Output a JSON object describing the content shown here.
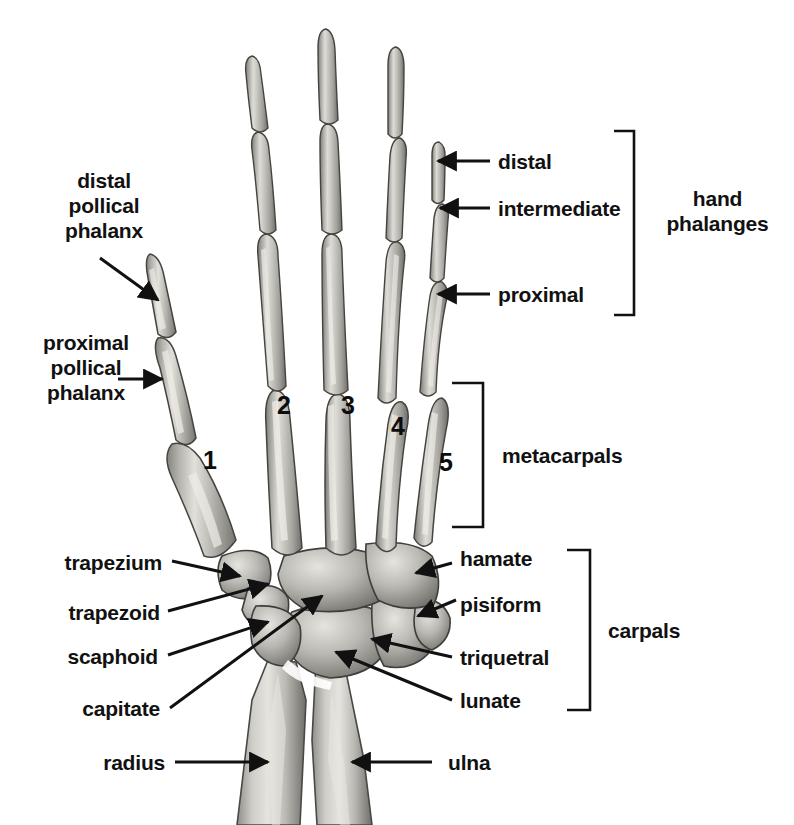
{
  "diagram": {
    "view": "dorsal view of right hand bones",
    "colors": {
      "background": "#ffffff",
      "bone": "#b3b1ad",
      "bone_highlight": "#e4e2dd",
      "bone_shadow": "#6e6c68",
      "outline": "#3a3936",
      "label_text": "#111111",
      "leader_line": "#111111"
    }
  },
  "labels": {
    "distal_pollical_phalanx": "distal\npollical\nphalanx",
    "proximal_pollical_phalanx": "proximal\npollical\nphalanx",
    "trapezium": "trapezium",
    "trapezoid": "trapezoid",
    "scaphoid": "scaphoid",
    "capitate": "capitate",
    "radius": "radius",
    "distal": "distal",
    "intermediate": "intermediate",
    "proximal": "proximal",
    "hand_phalanges": "hand\nphalanges",
    "metacarpals": "metacarpals",
    "hamate": "hamate",
    "pisiform": "pisiform",
    "triquetral": "triquetral",
    "lunate": "lunate",
    "carpals": "carpals",
    "ulna": "ulna"
  },
  "metacarpal_numbers": [
    {
      "value": "1",
      "bone": "first metacarpal (thumb)"
    },
    {
      "value": "2",
      "bone": "second metacarpal"
    },
    {
      "value": "3",
      "bone": "third metacarpal"
    },
    {
      "value": "4",
      "bone": "fourth metacarpal"
    },
    {
      "value": "5",
      "bone": "fifth metacarpal"
    }
  ],
  "brackets": [
    {
      "name": "hand phalanges",
      "label": "hand\nphalanges"
    },
    {
      "name": "metacarpals",
      "label": "metacarpals"
    },
    {
      "name": "carpals",
      "label": "carpals"
    }
  ],
  "bone_groups": {
    "phalanges": [
      "distal",
      "intermediate",
      "proximal"
    ],
    "metacarpals": [
      "1",
      "2",
      "3",
      "4",
      "5"
    ],
    "carpals": [
      "trapezium",
      "trapezoid",
      "scaphoid",
      "capitate",
      "hamate",
      "pisiform",
      "triquetral",
      "lunate"
    ],
    "forearm": [
      "radius",
      "ulna"
    ],
    "thumb": [
      "distal pollical phalanx",
      "proximal pollical phalanx"
    ]
  }
}
